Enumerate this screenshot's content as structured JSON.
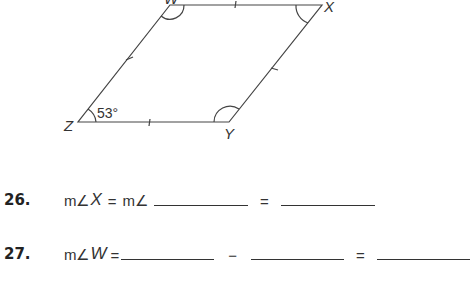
{
  "figure": {
    "type": "parallelogram",
    "vertices": {
      "W": "W",
      "X": "X",
      "Y": "Y",
      "Z": "Z"
    },
    "angle_label": "53°"
  },
  "problems": [
    {
      "number": "26.",
      "parts": {
        "m1": "m∠",
        "v1": "X",
        "eq1": "=",
        "m2": "m∠",
        "eq2": "="
      }
    },
    {
      "number": "27.",
      "parts": {
        "m1": "m∠",
        "v1": "W",
        "eq1": "=",
        "minus": "−",
        "eq2": "="
      }
    }
  ]
}
